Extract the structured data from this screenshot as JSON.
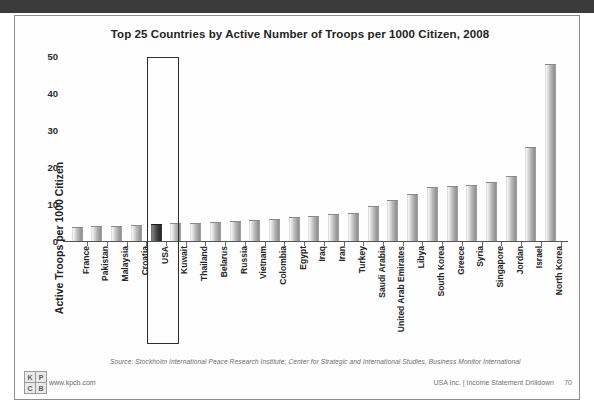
{
  "slide": {
    "title": "Top 25 Countries by Active Number of Troops per 1000 Citizen, 2008",
    "source_note": "Source: Stockholm International Peace Research Institute; Center for Strategic and International Studies, Business Monitor International",
    "footer_right": "USA Inc. | Income Statement Drilldown",
    "page_number": "70",
    "logo": {
      "cell_1": "K",
      "cell_2": "P",
      "cell_3": "C",
      "cell_4": "B",
      "url": "www.kpcb.com"
    }
  },
  "colors": {
    "bar_fill": "#bdbdbd",
    "bar_highlight": "#303030",
    "axis": "#555555",
    "text": "#232323",
    "top_band": "#3b3b3b",
    "callout_border": "#2d2d2d"
  },
  "highlight": {
    "country": "USA",
    "label": "USA callout box"
  },
  "chart_data": {
    "type": "bar",
    "title": "Top 25 Countries by Active Number of Troops per 1000 Citizen, 2008",
    "xlabel": "",
    "ylabel": "Active Troops per 1000 Citizen",
    "ylim": [
      0,
      50
    ],
    "yticks": [
      0,
      10,
      20,
      30,
      40,
      50
    ],
    "ytick_labels": [
      "0",
      "10",
      "20",
      "30",
      "40",
      "50"
    ],
    "grid": false,
    "legend": "none",
    "highlighted_category": "USA",
    "categories": [
      "France",
      "Pakistan",
      "Malaysia",
      "Croatia",
      "USA",
      "Kuwait",
      "Thailand",
      "Belarus",
      "Russia",
      "Vietnam",
      "Colombia",
      "Egypt",
      "Iraq",
      "Iran",
      "Turkey",
      "Saudi Arabia",
      "United Arab Emirates",
      "Libya",
      "South Korea",
      "Greece",
      "Syria",
      "Singapore",
      "Jordan",
      "Israel",
      "North Korea"
    ],
    "values": [
      3.8,
      4.0,
      4.0,
      4.2,
      4.7,
      4.8,
      5.0,
      5.2,
      5.5,
      5.7,
      6.0,
      6.5,
      6.7,
      7.4,
      7.7,
      9.5,
      11.2,
      12.6,
      14.6,
      14.8,
      15.2,
      16.0,
      17.6,
      25.5,
      47.8
    ]
  }
}
